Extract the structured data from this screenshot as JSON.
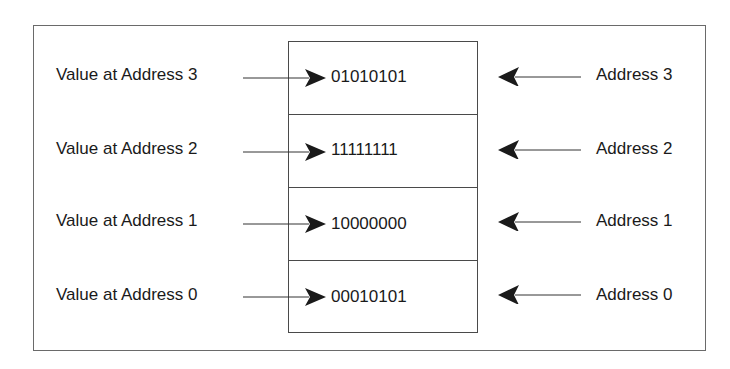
{
  "diagram": {
    "title": "",
    "rows": [
      {
        "left_label": "Value at Address 3",
        "value": "01010101",
        "right_label": "Address 3"
      },
      {
        "left_label": "Value at Address 2",
        "value": "11111111",
        "right_label": "Address 2"
      },
      {
        "left_label": "Value at Address 1",
        "value": "10000000",
        "right_label": "Address 1"
      },
      {
        "left_label": "Value at Address 0",
        "value": "00010101",
        "right_label": "Address 0"
      }
    ],
    "colors": {
      "line": "#4a4a4a",
      "text": "#1a1a1a",
      "arrowhead": "#1a1a1a"
    }
  }
}
